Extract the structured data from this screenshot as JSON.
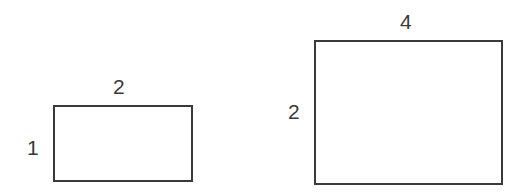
{
  "shapes": [
    {
      "name": "small-rectangle",
      "width_label": "2",
      "height_label": "1"
    },
    {
      "name": "large-rectangle",
      "width_label": "4",
      "height_label": "2"
    }
  ]
}
